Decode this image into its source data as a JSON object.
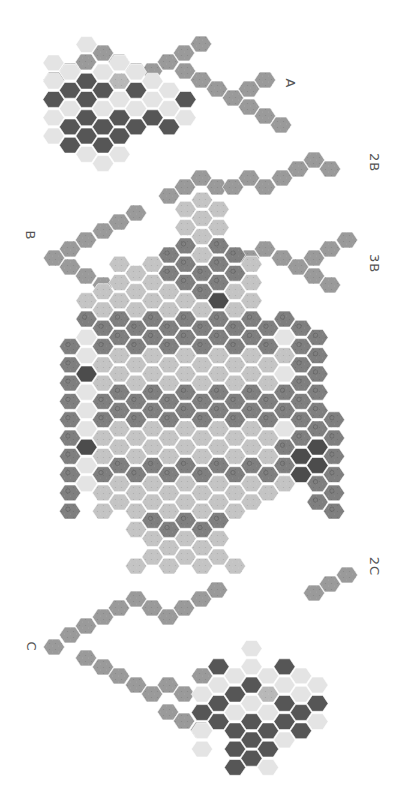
{
  "diagram": {
    "labels": [
      {
        "id": "A",
        "text": "A",
        "x": 292,
        "y": 84
      },
      {
        "id": "2B",
        "text": "2B",
        "x": 374,
        "y": 163
      },
      {
        "id": "B",
        "text": "B",
        "x": 31,
        "y": 236
      },
      {
        "id": "3B",
        "text": "3B",
        "x": 374,
        "y": 264
      },
      {
        "id": "2C",
        "text": "2C",
        "x": 374,
        "y": 567
      },
      {
        "id": "C",
        "text": "C",
        "x": 31,
        "y": 647
      }
    ],
    "colors": {
      "chain": "#9a9a9a",
      "pale": "#e4e4e4",
      "dark": "#565656",
      "core": "#b8b8b8",
      "mid": "#7f7f7f",
      "light": "#c4c4c4",
      "deep": "#4c4c4c",
      "stroke": "#ffffff"
    },
    "grid": {
      "x0": 70,
      "dx": 16.5,
      "y0": 346.5,
      "dy": 18.3,
      "r": 10.6
    },
    "spans": [
      {
        "r": -8,
        "c0": 8,
        "c1": 8,
        "t": "light"
      },
      {
        "r": -7,
        "c0": 7,
        "c1": 9,
        "t": "light"
      },
      {
        "r": -6,
        "c0": 7,
        "c1": 9,
        "t": "light"
      },
      {
        "r": -5,
        "c0": 6,
        "c1": 10,
        "t": "mid"
      },
      {
        "r": -5,
        "c0": 8,
        "c1": 8,
        "t": "light"
      },
      {
        "r": -4,
        "c0": 3,
        "c1": 5,
        "t": "light"
      },
      {
        "r": -4,
        "c0": 6,
        "c1": 10,
        "t": "mid"
      },
      {
        "r": -4,
        "c0": 11,
        "c1": 11,
        "t": "light"
      },
      {
        "r": -3,
        "c0": 2,
        "c1": 6,
        "t": "light"
      },
      {
        "r": -3,
        "c0": 7,
        "c1": 9,
        "t": "mid"
      },
      {
        "r": -3,
        "c0": 10,
        "c1": 11,
        "t": "light"
      },
      {
        "r": -2,
        "c0": 1,
        "c1": 8,
        "t": "light"
      },
      {
        "r": -2,
        "c0": 9,
        "c1": 9,
        "t": "deep"
      },
      {
        "r": -2,
        "c0": 10,
        "c1": 11,
        "t": "light"
      },
      {
        "r": -1,
        "c0": 1,
        "c1": 14,
        "t": "mid"
      },
      {
        "r": 0,
        "c0": 0,
        "c1": 0,
        "t": "mid"
      },
      {
        "r": 0,
        "c0": 1,
        "c1": 1,
        "t": "pale"
      },
      {
        "r": 0,
        "c0": 2,
        "c1": 12,
        "t": "mid"
      },
      {
        "r": 0,
        "c0": 13,
        "c1": 13,
        "t": "pale"
      },
      {
        "r": 0,
        "c0": 14,
        "c1": 15,
        "t": "mid"
      },
      {
        "r": 1,
        "c0": 0,
        "c1": 0,
        "t": "mid"
      },
      {
        "r": 1,
        "c0": 1,
        "c1": 1,
        "t": "pale"
      },
      {
        "r": 1,
        "c0": 2,
        "c1": 13,
        "t": "light"
      },
      {
        "r": 1,
        "c0": 14,
        "c1": 15,
        "t": "mid"
      },
      {
        "r": 2,
        "c0": 0,
        "c1": 0,
        "t": "mid"
      },
      {
        "r": 2,
        "c0": 1,
        "c1": 1,
        "t": "deep"
      },
      {
        "r": 2,
        "c0": 2,
        "c1": 12,
        "t": "light"
      },
      {
        "r": 2,
        "c0": 13,
        "c1": 13,
        "t": "pale"
      },
      {
        "r": 2,
        "c0": 14,
        "c1": 15,
        "t": "mid"
      },
      {
        "r": 3,
        "c0": 0,
        "c1": 0,
        "t": "mid"
      },
      {
        "r": 3,
        "c0": 1,
        "c1": 1,
        "t": "pale"
      },
      {
        "r": 3,
        "c0": 2,
        "c1": 15,
        "t": "mid"
      },
      {
        "r": 4,
        "c0": 0,
        "c1": 0,
        "t": "mid"
      },
      {
        "r": 4,
        "c0": 1,
        "c1": 1,
        "t": "pale"
      },
      {
        "r": 4,
        "c0": 2,
        "c1": 14,
        "t": "mid"
      },
      {
        "r": 4,
        "c0": 15,
        "c1": 16,
        "t": "mid"
      },
      {
        "r": 5,
        "c0": 0,
        "c1": 0,
        "t": "mid"
      },
      {
        "r": 5,
        "c0": 1,
        "c1": 1,
        "t": "pale"
      },
      {
        "r": 5,
        "c0": 2,
        "c1": 12,
        "t": "light"
      },
      {
        "r": 5,
        "c0": 13,
        "c1": 13,
        "t": "pale"
      },
      {
        "r": 5,
        "c0": 14,
        "c1": 16,
        "t": "mid"
      },
      {
        "r": 6,
        "c0": 0,
        "c1": 0,
        "t": "mid"
      },
      {
        "r": 6,
        "c0": 1,
        "c1": 1,
        "t": "deep"
      },
      {
        "r": 6,
        "c0": 2,
        "c1": 12,
        "t": "light"
      },
      {
        "r": 6,
        "c0": 13,
        "c1": 13,
        "t": "mid"
      },
      {
        "r": 6,
        "c0": 14,
        "c1": 15,
        "t": "deep"
      },
      {
        "r": 6,
        "c0": 16,
        "c1": 16,
        "t": "mid"
      },
      {
        "r": 7,
        "c0": 0,
        "c1": 0,
        "t": "mid"
      },
      {
        "r": 7,
        "c0": 1,
        "c1": 1,
        "t": "pale"
      },
      {
        "r": 7,
        "c0": 2,
        "c1": 13,
        "t": "mid"
      },
      {
        "r": 7,
        "c0": 14,
        "c1": 15,
        "t": "deep"
      },
      {
        "r": 7,
        "c0": 16,
        "c1": 16,
        "t": "mid"
      },
      {
        "r": 8,
        "c0": 0,
        "c1": 0,
        "t": "mid"
      },
      {
        "r": 8,
        "c0": 1,
        "c1": 1,
        "t": "pale"
      },
      {
        "r": 8,
        "c0": 2,
        "c1": 13,
        "t": "light"
      },
      {
        "r": 8,
        "c0": 15,
        "c1": 16,
        "t": "mid"
      },
      {
        "r": 9,
        "c0": 0,
        "c1": 0,
        "t": "mid"
      },
      {
        "r": 9,
        "c0": 2,
        "c1": 11,
        "t": "light"
      },
      {
        "r": 9,
        "c0": 15,
        "c1": 16,
        "t": "mid"
      },
      {
        "r": 10,
        "c0": 4,
        "c1": 8,
        "t": "light"
      },
      {
        "r": 10,
        "c0": 5,
        "c1": 9,
        "t": "mid"
      },
      {
        "r": 11,
        "c0": 5,
        "c1": 9,
        "t": "light"
      },
      {
        "r": 12,
        "c0": 4,
        "c1": 10,
        "t": "light"
      }
    ],
    "clusters": [
      {
        "id": "cluster-2B",
        "cells": [
          [
            -1,
            -15,
            "pale"
          ],
          [
            0,
            -15,
            "pale"
          ],
          [
            1,
            -16,
            "pale"
          ],
          [
            2,
            -15,
            "pale"
          ],
          [
            3,
            -15,
            "pale"
          ],
          [
            4,
            -15,
            "pale"
          ],
          [
            -1,
            -14,
            "pale"
          ],
          [
            0,
            -14,
            "dark"
          ],
          [
            1,
            -14,
            "dark"
          ],
          [
            2,
            -14,
            "dark"
          ],
          [
            3,
            -14,
            "core"
          ],
          [
            4,
            -14,
            "dark"
          ],
          [
            5,
            -14,
            "pale"
          ],
          [
            6,
            -14,
            "pale"
          ],
          [
            -1,
            -13,
            "dark"
          ],
          [
            0,
            -13,
            "pale"
          ],
          [
            1,
            -13,
            "dark"
          ],
          [
            2,
            -13,
            "pale"
          ],
          [
            3,
            -13,
            "pale"
          ],
          [
            4,
            -13,
            "pale"
          ],
          [
            5,
            -13,
            "pale"
          ],
          [
            6,
            -13,
            "pale"
          ],
          [
            7,
            -13,
            "dark"
          ],
          [
            -1,
            -12,
            "pale"
          ],
          [
            0,
            -12,
            "dark"
          ],
          [
            1,
            -12,
            "dark"
          ],
          [
            2,
            -12,
            "dark"
          ],
          [
            3,
            -12,
            "dark"
          ],
          [
            4,
            -12,
            "dark"
          ],
          [
            5,
            -12,
            "dark"
          ],
          [
            6,
            -12,
            "dark"
          ],
          [
            7,
            -12,
            "pale"
          ],
          [
            -1,
            -11,
            "pale"
          ],
          [
            0,
            -11,
            "dark"
          ],
          [
            1,
            -11,
            "dark"
          ],
          [
            2,
            -11,
            "dark"
          ],
          [
            3,
            -11,
            "dark"
          ],
          [
            1,
            -10,
            "pale"
          ],
          [
            2,
            -10,
            "pale"
          ],
          [
            3,
            -10,
            "pale"
          ]
        ]
      },
      {
        "id": "cluster-2C",
        "cells": [
          [
            11,
            17,
            "pale"
          ],
          [
            10,
            18,
            "pale"
          ],
          [
            11,
            18,
            "pale"
          ],
          [
            12,
            18,
            "pale"
          ],
          [
            8,
            18,
            "chain"
          ],
          [
            9,
            18,
            "dark"
          ],
          [
            10,
            19,
            "dark"
          ],
          [
            11,
            19,
            "dark"
          ],
          [
            12,
            19,
            "core"
          ],
          [
            13,
            18,
            "dark"
          ],
          [
            14,
            18,
            "pale"
          ],
          [
            8,
            19,
            "pale"
          ],
          [
            9,
            19,
            "pale"
          ],
          [
            10,
            20,
            "pale"
          ],
          [
            11,
            20,
            "pale"
          ],
          [
            12,
            20,
            "pale"
          ],
          [
            13,
            19,
            "pale"
          ],
          [
            14,
            19,
            "pale"
          ],
          [
            15,
            19,
            "pale"
          ],
          [
            8,
            20,
            "dark"
          ],
          [
            9,
            20,
            "dark"
          ],
          [
            10,
            21,
            "dark"
          ],
          [
            11,
            21,
            "dark"
          ],
          [
            12,
            21,
            "dark"
          ],
          [
            13,
            20,
            "dark"
          ],
          [
            14,
            20,
            "dark"
          ],
          [
            15,
            20,
            "dark"
          ],
          [
            8,
            21,
            "pale"
          ],
          [
            9,
            21,
            "dark"
          ],
          [
            10,
            22,
            "dark"
          ],
          [
            11,
            22,
            "dark"
          ],
          [
            12,
            22,
            "dark"
          ],
          [
            13,
            21,
            "dark"
          ],
          [
            14,
            21,
            "dark"
          ],
          [
            15,
            21,
            "pale"
          ],
          [
            8,
            22,
            "pale"
          ],
          [
            10,
            23,
            "dark"
          ],
          [
            11,
            23,
            "dark"
          ],
          [
            12,
            23,
            "pale"
          ],
          [
            13,
            22,
            "pale"
          ]
        ]
      }
    ],
    "chains": [
      {
        "id": "chain-A",
        "points": [
          [
            54,
            80
          ],
          [
            70,
            71
          ],
          [
            86,
            62
          ],
          [
            103,
            53
          ],
          [
            119,
            62
          ],
          [
            136,
            71
          ],
          [
            152,
            71
          ],
          [
            168,
            62
          ],
          [
            184,
            53
          ],
          [
            201,
            44
          ],
          [
            185,
            71
          ],
          [
            201,
            80
          ],
          [
            217,
            89
          ],
          [
            233,
            98
          ],
          [
            249,
            89
          ],
          [
            265,
            80
          ],
          [
            249,
            107
          ],
          [
            265,
            116
          ],
          [
            281,
            125
          ]
        ]
      },
      {
        "id": "chain-2B",
        "points": [
          [
            169,
            196
          ],
          [
            185,
            187
          ],
          [
            201,
            178
          ],
          [
            217,
            187
          ],
          [
            233,
            187
          ],
          [
            249,
            178
          ],
          [
            265,
            187
          ],
          [
            282,
            178
          ],
          [
            298,
            169
          ],
          [
            314,
            160
          ],
          [
            330,
            169
          ]
        ]
      },
      {
        "id": "chain-B",
        "points": [
          [
            136,
            213
          ],
          [
            119,
            222
          ],
          [
            103,
            231
          ],
          [
            86,
            240
          ],
          [
            70,
            249
          ],
          [
            54,
            258
          ],
          [
            70,
            267
          ],
          [
            86,
            276
          ],
          [
            103,
            285
          ]
        ]
      },
      {
        "id": "chain-3B",
        "points": [
          [
            249,
            258
          ],
          [
            265,
            249
          ],
          [
            282,
            258
          ],
          [
            298,
            267
          ],
          [
            314,
            258
          ],
          [
            330,
            249
          ],
          [
            347,
            240
          ],
          [
            314,
            276
          ],
          [
            330,
            285
          ]
        ]
      },
      {
        "id": "chain-2C",
        "points": [
          [
            314,
            593
          ],
          [
            330,
            584
          ],
          [
            347,
            575
          ]
        ]
      },
      {
        "id": "chain-C",
        "points": [
          [
            217,
            590
          ],
          [
            201,
            599
          ],
          [
            184,
            608
          ],
          [
            168,
            617
          ],
          [
            152,
            608
          ],
          [
            136,
            599
          ],
          [
            119,
            608
          ],
          [
            103,
            617
          ],
          [
            86,
            626
          ],
          [
            70,
            635
          ],
          [
            54,
            647
          ],
          [
            86,
            658
          ],
          [
            103,
            667
          ],
          [
            119,
            676
          ],
          [
            136,
            685
          ],
          [
            152,
            694
          ],
          [
            168,
            685
          ],
          [
            184,
            694
          ],
          [
            168,
            712
          ],
          [
            184,
            721
          ],
          [
            201,
            730
          ]
        ]
      }
    ]
  }
}
